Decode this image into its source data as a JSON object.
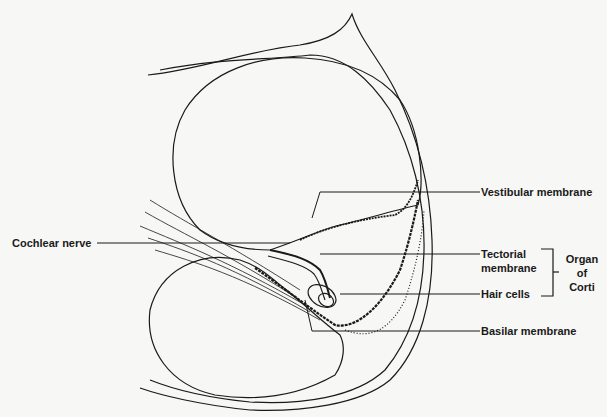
{
  "diagram": {
    "labels": {
      "vestibular_membrane": "Vestibular membrane",
      "cochlear_nerve": "Cochlear nerve",
      "tectorial_membrane_line1": "Tectorial",
      "tectorial_membrane_line2": "membrane",
      "hair_cells": "Hair cells",
      "basilar_membrane": "Basilar membrane",
      "organ_of_corti_line1": "Organ",
      "organ_of_corti_line2": "of",
      "organ_of_corti_line3": "Corti"
    },
    "colors": {
      "ink": "#1a1a1a",
      "paper": "#f7f7f5"
    }
  }
}
